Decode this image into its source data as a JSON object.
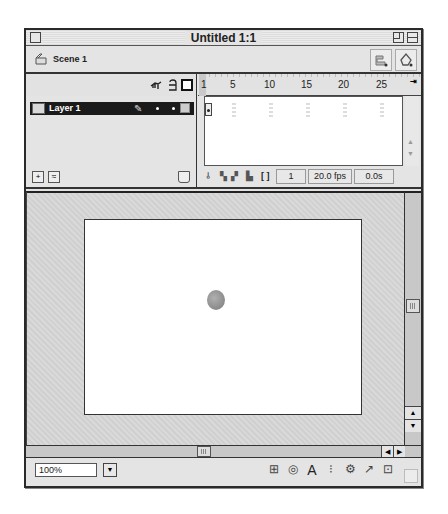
{
  "window": {
    "title": "Untitled 1:1"
  },
  "scenebar": {
    "scene_label": "Scene 1",
    "edit_symbols_icon": "edit-symbols-icon",
    "edit_scene_icon": "edit-scene-icon"
  },
  "timeline": {
    "header_icons": [
      "eye-icon",
      "lock-icon",
      "outline-icon"
    ],
    "layers": [
      {
        "name": "Layer 1",
        "selected": true
      }
    ],
    "ruler_ticks": [
      {
        "label": "1",
        "x": 3
      },
      {
        "label": "5",
        "x": 32
      },
      {
        "label": "10",
        "x": 68
      },
      {
        "label": "15",
        "x": 105
      },
      {
        "label": "20",
        "x": 142
      },
      {
        "label": "25",
        "x": 180
      }
    ],
    "frame_view_menu": "⇥",
    "footer": {
      "current_frame": "1",
      "frame_rate": "20.0 fps",
      "elapsed_time": "0.0s"
    }
  },
  "stage": {
    "background_color": "#ffffff",
    "objects": [
      {
        "type": "circle",
        "color": "#8c8c8c"
      }
    ]
  },
  "statusbar": {
    "zoom_value": "100%",
    "dropdown_arrow": "▼",
    "icons": [
      {
        "name": "info-panel-icon",
        "glyph": "⊞"
      },
      {
        "name": "mixer-icon",
        "glyph": "◎"
      },
      {
        "name": "character-icon",
        "glyph": "A"
      },
      {
        "name": "instance-icon",
        "glyph": "⁝"
      },
      {
        "name": "movie-explorer-icon",
        "glyph": "⚙"
      },
      {
        "name": "actions-icon",
        "glyph": "↗"
      },
      {
        "name": "library-icon",
        "glyph": "⊡"
      }
    ]
  }
}
